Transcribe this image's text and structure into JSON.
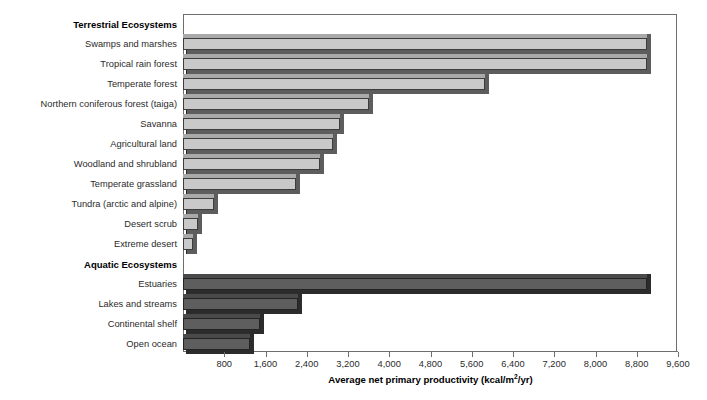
{
  "chart_data": {
    "type": "bar",
    "orientation": "horizontal",
    "title": "",
    "xlabel": "Average net primary productivity (kcal/m2/yr)",
    "xlabel_parts": {
      "before": "Average net primary productivity (kcal/m",
      "superscript": "2",
      "after": "/yr)"
    },
    "ylabel": "",
    "xlim": [
      0,
      9600
    ],
    "xticks": [
      0,
      800,
      1600,
      2400,
      3200,
      4000,
      4800,
      5600,
      6400,
      7200,
      8000,
      8800,
      9600
    ],
    "xtick_labels": [
      "",
      "800",
      "1,600",
      "2,400",
      "3,200",
      "4,000",
      "4,800",
      "5,600",
      "6,400",
      "7,200",
      "8,000",
      "8,800",
      "9,600"
    ],
    "grid": false,
    "legend": "none",
    "groups": [
      {
        "name": "Terrestrial Ecosystems",
        "style": "terrestrial",
        "color": "#c9c9c9",
        "categories": [
          "Swamps and marshes",
          "Tropical rain forest",
          "Temperate forest",
          "Northern coniferous forest (taiga)",
          "Savanna",
          "Agricultural land",
          "Woodland and shrubland",
          "Temperate grassland",
          "Tundra (arctic and alpine)",
          "Desert scrub",
          "Extreme desert"
        ],
        "values": [
          9000,
          9000,
          5850,
          3600,
          3050,
          2900,
          2650,
          2200,
          600,
          300,
          200
        ]
      },
      {
        "name": "Aquatic Ecosystems",
        "style": "aquatic",
        "color": "#5e5e5e",
        "categories": [
          "Estuaries",
          "Lakes and streams",
          "Continental shelf",
          "Open ocean"
        ],
        "values": [
          9000,
          2230,
          1500,
          1300
        ]
      }
    ]
  },
  "layout": {
    "row_pitch": 20,
    "first_row_y": 24,
    "plot_left": 183,
    "plot_right": 678,
    "plot_top": 14,
    "axis_y": 351,
    "bar_height": 12,
    "px_per_unit": 0.0515625
  },
  "colors": {
    "terrestrial_face": "#c9c9c9",
    "terrestrial_shade": "#5d5d5d",
    "aquatic_face": "#5e5e5e",
    "aquatic_shade": "#2c2c2c",
    "frame": "#6e6e6e",
    "text": "#2b2b2b",
    "background": "#ffffff"
  }
}
